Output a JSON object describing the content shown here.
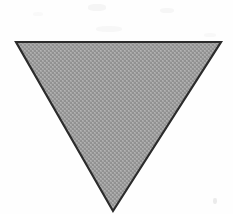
{
  "image": {
    "title": "Inverted gray triangle",
    "description": "A downward-pointing (inverted) equilateral-like triangle filled with a dithered gray halftone pattern and outlined with a thin dark border, centered on a white background.",
    "width": 233,
    "height": 214,
    "background_color": "#fefefe"
  },
  "shape": {
    "name": "triangle",
    "orientation": "point-down",
    "vertex_count": 3,
    "points": "16,42 221,42 113,211",
    "vertices": [
      {
        "label": "top-left",
        "x": 16,
        "y": 42
      },
      {
        "label": "top-right",
        "x": 221,
        "y": 42
      },
      {
        "label": "bottom-apex",
        "x": 113,
        "y": 211
      }
    ],
    "fill_color": "#9e9e9e",
    "fill_pattern": "dither-halftone",
    "pattern_dot_color": "#8a8a8a",
    "pattern_light_color": "#b0b0b0",
    "stroke_color": "#2b2b2b",
    "stroke_width": 2.2,
    "base_width_px": 205,
    "height_px": 169
  },
  "artifacts": {
    "label": "scan-noise",
    "speck_color": "#ededed",
    "count": 6
  }
}
